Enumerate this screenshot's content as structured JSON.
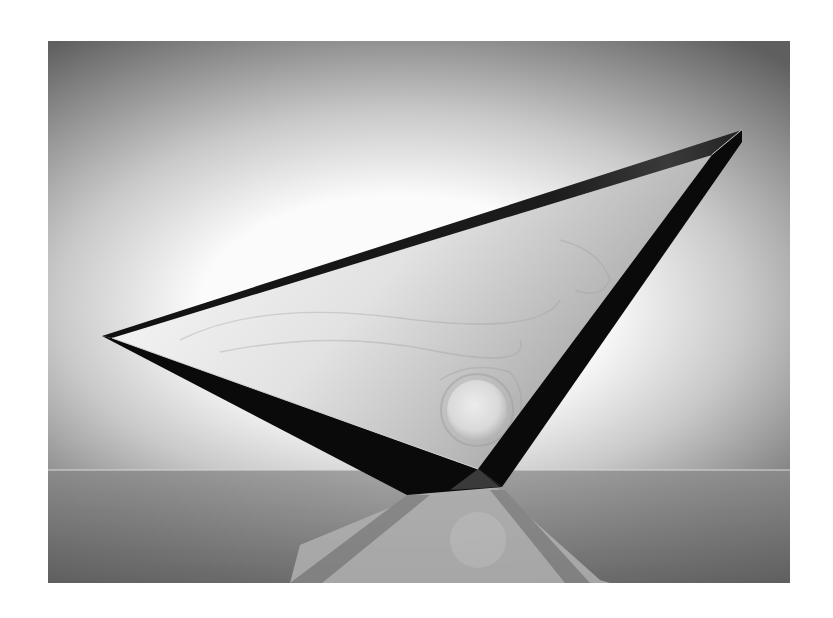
{
  "page": {
    "background": "#ffffff",
    "width": 833,
    "height": 618
  },
  "photo": {
    "alt": "Black-and-white photograph of a triangular glass sculpture resting on one vertex over a reflective surface",
    "frame": {
      "x": 48,
      "y": 41,
      "width": 742,
      "height": 542
    },
    "background": {
      "center_color": "#fbfbfb",
      "mid_color": "#c9c9c9",
      "edge_color": "#5f5f5f",
      "glow_center": {
        "x": 400,
        "y": 300
      }
    },
    "horizon": {
      "y": 470,
      "line_color": "#d8d8d8",
      "floor_top_color": "#9d9d9d",
      "floor_bottom_color": "#6a6a6a"
    },
    "sculpture": {
      "left_tip": {
        "x": 102,
        "y": 336
      },
      "top_right_tip": {
        "x": 742,
        "y": 130
      },
      "inner_top_right": {
        "x": 712,
        "y": 155
      },
      "inner_left": {
        "x": 112,
        "y": 338
      },
      "bottom_inner_vertex": {
        "x": 478,
        "y": 469
      },
      "bottom_left": {
        "x": 407,
        "y": 495
      },
      "bottom_right": {
        "x": 502,
        "y": 487
      },
      "edge_color": "#0a0a0a",
      "face_light": "#f4f4f4",
      "face_shadow": "#a8a8a8",
      "orb": {
        "cx": 477,
        "cy": 410,
        "r": 30,
        "color": "#d9d9d9"
      }
    },
    "reflection": {
      "band_color": "#7d7d7d",
      "face_color": "#a9a9a9",
      "orb": {
        "cx": 478,
        "cy": 540,
        "r": 28
      }
    }
  }
}
